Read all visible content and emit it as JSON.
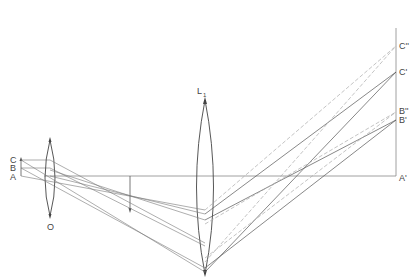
{
  "diagram": {
    "title": "",
    "object_labels": {
      "c": "C",
      "b": "B",
      "a": "A"
    },
    "lens_objective_label": "O",
    "lens_eyepiece_label": "L",
    "lens_eyepiece_subscript": "1",
    "image_labels": {
      "c_double_prime": "C''",
      "c_prime": "C'",
      "b_double_prime": "B''",
      "b_prime": "B'",
      "a_prime": "A'"
    },
    "colors": {
      "line": "#555555",
      "light_line": "#999999",
      "dashed": "#aaaaaa"
    }
  }
}
